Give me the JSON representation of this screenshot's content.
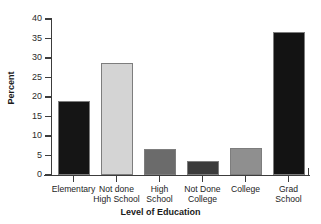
{
  "chart_data": {
    "type": "bar",
    "title": "",
    "xlabel": "Level of Education",
    "ylabel": "Percent",
    "categories": [
      "Elementary",
      "Not done\nHigh School",
      "High\nSchool",
      "Not Done\nCollege",
      "College",
      "Grad\nSchool"
    ],
    "values": [
      19.1,
      28.8,
      6.6,
      3.5,
      6.8,
      36.6
    ],
    "bar_colors": [
      "#151515",
      "#d4d4d4",
      "#6b6b6b",
      "#3b3b3b",
      "#8f8f8f",
      "#131313"
    ],
    "ylim": [
      0,
      40
    ],
    "ytick_values": [
      0,
      5,
      10,
      15,
      20,
      25,
      30,
      35,
      40
    ],
    "ytick_labels": [
      "0",
      "5",
      "10",
      "15",
      "20",
      "25",
      "30",
      "35",
      "40"
    ],
    "grid": false,
    "legend": false,
    "legend_position": "none",
    "axis_color": "#3c3c3c"
  }
}
